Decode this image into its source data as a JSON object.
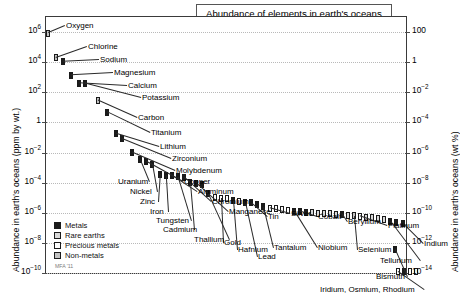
{
  "chart_data": {
    "type": "scatter",
    "title": "Abundance of elements in earth's oceans",
    "ylabel_left": "Abundance in earth's oceans (ppm by wt.)",
    "ylabel_right": "Abundance in earth's oceans (wt %)",
    "xlabel": "",
    "grid": true,
    "legend_position": "bottom-left",
    "credit": "MFA '11",
    "ylim_left": [
      1e-10,
      10000000.0
    ],
    "ylim_right": [
      1e-14,
      1000.0
    ],
    "yticks_left": [
      "10^6",
      "10^4",
      "10^2",
      "1",
      "10^-2",
      "10^-4",
      "10^-6",
      "10^-8",
      "10^-10"
    ],
    "yticks_left_display": [
      {
        "mant": "10",
        "exp": "6"
      },
      {
        "mant": "10",
        "exp": "4"
      },
      {
        "mant": "10",
        "exp": "2"
      },
      {
        "mant": "1",
        "exp": ""
      },
      {
        "mant": "10",
        "exp": "−2"
      },
      {
        "mant": "10",
        "exp": "−4"
      },
      {
        "mant": "10",
        "exp": "−6"
      },
      {
        "mant": "10",
        "exp": "−8"
      },
      {
        "mant": "10",
        "exp": "−10"
      }
    ],
    "yticks_right_display": [
      {
        "mant": "100",
        "exp": ""
      },
      {
        "mant": "1",
        "exp": ""
      },
      {
        "mant": "10",
        "exp": "−2"
      },
      {
        "mant": "10",
        "exp": "−4"
      },
      {
        "mant": "10",
        "exp": "−6"
      },
      {
        "mant": "10",
        "exp": "−8"
      },
      {
        "mant": "10",
        "exp": "−10"
      },
      {
        "mant": "10",
        "exp": "−12"
      },
      {
        "mant": "10",
        "exp": "−14"
      }
    ],
    "legend": [
      {
        "label": "Metals",
        "cls": "metals",
        "color": "#1b1b1b"
      },
      {
        "label": "Rare earths",
        "cls": "rare",
        "color": "#d8d8d8"
      },
      {
        "label": "Precious metals",
        "cls": "precious",
        "color": "#fdfdfd"
      },
      {
        "label": "Non-metals",
        "cls": "nonmetals",
        "color": "#c2c2c2"
      }
    ],
    "points": [
      {
        "name": "Oxygen",
        "x": 2,
        "value": 857000,
        "cls": "nonmetals"
      },
      {
        "name": "Chlorine",
        "x": 10,
        "value": 19000,
        "cls": "nonmetals"
      },
      {
        "name": "Sodium",
        "x": 17,
        "value": 10500,
        "cls": "metals"
      },
      {
        "name": "Magnesium",
        "x": 25,
        "value": 1350,
        "cls": "metals"
      },
      {
        "name": "Calcium",
        "x": 33,
        "value": 400,
        "cls": "metals"
      },
      {
        "name": "Potassium",
        "x": 39,
        "value": 380,
        "cls": "metals"
      },
      {
        "name": "Carbon",
        "x": 52,
        "value": 28,
        "cls": "nonmetals"
      },
      {
        "name": "Titanium",
        "x": 61,
        "value": 4.8,
        "cls": "metals"
      },
      {
        "name": "Lithium",
        "x": 70,
        "value": 0.18,
        "cls": "metals"
      },
      {
        "name": "Zirconium",
        "x": 76,
        "value": 0.08,
        "cls": "metals"
      },
      {
        "name": "Molybdenum",
        "x": 86,
        "value": 0.01,
        "cls": "metals"
      },
      {
        "name": "Uranium",
        "x": 94,
        "value": 0.0033,
        "cls": "metals"
      },
      {
        "name": "Copper",
        "x": 100,
        "value": 0.0025,
        "cls": "metals"
      },
      {
        "name": "Nickel",
        "x": 106,
        "value": 0.0015,
        "cls": "metals"
      },
      {
        "name": "Zinc",
        "x": 114,
        "value": 0.00035,
        "cls": "metals"
      },
      {
        "name": "Iron",
        "x": 120,
        "value": 0.0003,
        "cls": "metals"
      },
      {
        "name": "Aluminum",
        "x": 126,
        "value": 0.00028,
        "cls": "metals"
      },
      {
        "name": "Tungsten",
        "x": 132,
        "value": 0.00025,
        "cls": "metals"
      },
      {
        "name": "Chromium",
        "x": 138,
        "value": 0.00022,
        "cls": "metals"
      },
      {
        "name": "Cadmium",
        "x": 144,
        "value": 0.00011,
        "cls": "metals"
      },
      {
        "name": "Manganese",
        "x": 150,
        "value": 9e-05,
        "cls": "metals"
      },
      {
        "name": "",
        "x": 156,
        "value": 7e-05,
        "cls": "metals"
      },
      {
        "name": "Thallium",
        "x": 162,
        "value": 2e-05,
        "cls": "metals"
      },
      {
        "name": "",
        "x": 169,
        "value": 1.05e-05,
        "cls": "precious"
      },
      {
        "name": "Gold",
        "x": 175,
        "value": 9.5e-06,
        "cls": "precious"
      },
      {
        "name": "",
        "x": 181,
        "value": 8.8e-06,
        "cls": "precious"
      },
      {
        "name": "Hafnium",
        "x": 187,
        "value": 7e-06,
        "cls": "metals"
      },
      {
        "name": "",
        "x": 193,
        "value": 5.8e-06,
        "cls": "precious"
      },
      {
        "name": "Lead",
        "x": 199,
        "value": 5e-06,
        "cls": "metals"
      },
      {
        "name": "Tin",
        "x": 205,
        "value": 4.5e-06,
        "cls": "metals"
      },
      {
        "name": "",
        "x": 211,
        "value": 3.6e-06,
        "cls": "metals"
      },
      {
        "name": "Tantalum",
        "x": 217,
        "value": 2.5e-06,
        "cls": "metals"
      },
      {
        "name": "Silver",
        "x": 224,
        "value": 2e-06,
        "cls": "precious"
      },
      {
        "name": "",
        "x": 230,
        "value": 1.8e-06,
        "cls": "precious"
      },
      {
        "name": "",
        "x": 236,
        "value": 1.6e-06,
        "cls": "precious"
      },
      {
        "name": "",
        "x": 242,
        "value": 1.5e-06,
        "cls": "precious"
      },
      {
        "name": "Niobium",
        "x": 248,
        "value": 1.3e-06,
        "cls": "metals"
      },
      {
        "name": "Cobalt",
        "x": 254,
        "value": 1.2e-06,
        "cls": "metals"
      },
      {
        "name": "",
        "x": 260,
        "value": 1.1e-06,
        "cls": "metals"
      },
      {
        "name": "",
        "x": 266,
        "value": 1e-06,
        "cls": "rare"
      },
      {
        "name": "",
        "x": 272,
        "value": 9.5e-07,
        "cls": "rare"
      },
      {
        "name": "",
        "x": 278,
        "value": 9e-07,
        "cls": "rare"
      },
      {
        "name": "",
        "x": 284,
        "value": 8.5e-07,
        "cls": "rare"
      },
      {
        "name": "",
        "x": 290,
        "value": 8e-07,
        "cls": "rare"
      },
      {
        "name": "Beryllium",
        "x": 296,
        "value": 7.5e-07,
        "cls": "metals"
      },
      {
        "name": "",
        "x": 302,
        "value": 7e-07,
        "cls": "rare"
      },
      {
        "name": "Selenium",
        "x": 308,
        "value": 6.2e-07,
        "cls": "nonmetals"
      },
      {
        "name": "Platinum",
        "x": 314,
        "value": 5.8e-07,
        "cls": "precious"
      },
      {
        "name": "",
        "x": 320,
        "value": 5.2e-07,
        "cls": "rare"
      },
      {
        "name": "",
        "x": 326,
        "value": 4.6e-07,
        "cls": "rare"
      },
      {
        "name": "",
        "x": 332,
        "value": 4e-07,
        "cls": "rare"
      },
      {
        "name": "",
        "x": 338,
        "value": 3.4e-07,
        "cls": "rare"
      },
      {
        "name": "Tellurium",
        "x": 344,
        "value": 2.6e-07,
        "cls": "metals"
      },
      {
        "name": "",
        "x": 350,
        "value": 2.2e-07,
        "cls": "metals"
      },
      {
        "name": "Indium",
        "x": 357,
        "value": 1.8e-07,
        "cls": "metals"
      },
      {
        "name": "Bismuth",
        "x": 349,
        "value": 3.5e-09,
        "cls": "metals"
      },
      {
        "name": "Iridium, Osmium, Rhodium",
        "x": 352,
        "value": 1.2e-10,
        "cls": "precious"
      },
      {
        "name": "",
        "x": 358,
        "value": 1.2e-10,
        "cls": "metals"
      },
      {
        "name": "",
        "x": 364,
        "value": 1.2e-10,
        "cls": "precious"
      },
      {
        "name": "",
        "x": 370,
        "value": 1.2e-10,
        "cls": "precious"
      }
    ],
    "annotations": [
      {
        "text": "Oxygen",
        "x": 20,
        "y": 4
      },
      {
        "text": "Chlorine",
        "x": 42,
        "y": 25
      },
      {
        "text": "Sodium",
        "x": 54,
        "y": 38
      },
      {
        "text": "Magnesium",
        "x": 68,
        "y": 51
      },
      {
        "text": "Calcium",
        "x": 82,
        "y": 64
      },
      {
        "text": "Potassium",
        "x": 96,
        "y": 76
      },
      {
        "text": "Carbon",
        "x": 92,
        "y": 96
      },
      {
        "text": "Titanium",
        "x": 105,
        "y": 111
      },
      {
        "text": "Lithium",
        "x": 114,
        "y": 125
      },
      {
        "text": "Zirconium",
        "x": 126,
        "y": 137
      },
      {
        "text": "Molybdenum",
        "x": 130,
        "y": 149
      },
      {
        "text": "Uranium",
        "x": 72,
        "y": 160
      },
      {
        "text": "Copper",
        "x": 138,
        "y": 160
      },
      {
        "text": "Nickel",
        "x": 84,
        "y": 170
      },
      {
        "text": "Aluminum",
        "x": 152,
        "y": 170
      },
      {
        "text": "Zinc",
        "x": 94,
        "y": 180
      },
      {
        "text": "Chromium",
        "x": 166,
        "y": 180
      },
      {
        "text": "Iron",
        "x": 104,
        "y": 190
      },
      {
        "text": "Manganese",
        "x": 183,
        "y": 190
      },
      {
        "text": "Tungsten",
        "x": 110,
        "y": 199
      },
      {
        "text": "Tin",
        "x": 222,
        "y": 195
      },
      {
        "text": "Silver",
        "x": 245,
        "y": 192
      },
      {
        "text": "Cobalt",
        "x": 272,
        "y": 195
      },
      {
        "text": "Cadmium",
        "x": 117,
        "y": 208
      },
      {
        "text": "Beryllium",
        "x": 302,
        "y": 200
      },
      {
        "text": "Platinum",
        "x": 342,
        "y": 204
      },
      {
        "text": "Thallium",
        "x": 148,
        "y": 218
      },
      {
        "text": "Gold",
        "x": 178,
        "y": 221
      },
      {
        "text": "Hafnium",
        "x": 192,
        "y": 228
      },
      {
        "text": "Tantalum",
        "x": 228,
        "y": 226
      },
      {
        "text": "Niobium",
        "x": 272,
        "y": 226
      },
      {
        "text": "Selenium",
        "x": 312,
        "y": 228
      },
      {
        "text": "Lead",
        "x": 212,
        "y": 235
      },
      {
        "text": "Indium",
        "x": 378,
        "y": 222
      },
      {
        "text": "Tellurium",
        "x": 334,
        "y": 239
      },
      {
        "text": "Bismuth",
        "x": 330,
        "y": 255
      },
      {
        "text": "Iridium, Osmium, Rhodium",
        "x": 274,
        "y": 268
      }
    ]
  }
}
